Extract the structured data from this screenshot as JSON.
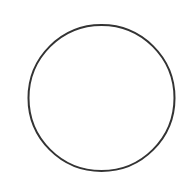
{
  "canvas": {
    "width": 179,
    "height": 183,
    "background": "#ffffff"
  },
  "shape": {
    "type": "circle",
    "cx": 101.5,
    "cy": 98,
    "r": 73,
    "stroke": "#333333",
    "stroke_width": 2,
    "fill": "none"
  }
}
